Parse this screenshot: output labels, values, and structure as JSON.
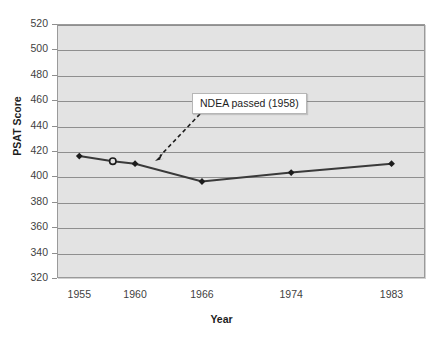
{
  "chart_data": {
    "type": "line",
    "title": "",
    "xlabel": "Year",
    "ylabel": "PSAT Score",
    "x": [
      1955,
      1958,
      1960,
      1966,
      1974,
      1983
    ],
    "values": [
      416,
      412,
      410,
      396,
      403,
      410
    ],
    "categories": [
      "1955",
      "1958",
      "1960",
      "1966",
      "1974",
      "1983"
    ],
    "x_tick_labels": [
      "1955",
      "1960",
      "1966",
      "1974",
      "1983"
    ],
    "x_tick_values": [
      1955,
      1960,
      1966,
      1974,
      1983
    ],
    "y_tick_labels": [
      "320",
      "340",
      "360",
      "380",
      "400",
      "420",
      "440",
      "460",
      "480",
      "500",
      "520"
    ],
    "y_tick_values": [
      320,
      340,
      360,
      380,
      400,
      420,
      440,
      460,
      480,
      500,
      520
    ],
    "ylim": [
      320,
      520
    ],
    "xlim": [
      1953,
      1986
    ],
    "grid": "horizontal",
    "legend": "none",
    "series_color": "#3a3a3a",
    "plot_background": "#e3e3e3",
    "annotations": [
      {
        "text": "NDEA passed (1958)",
        "points_to_x": 1958,
        "points_to_y": 412,
        "arrow_style": "dashed"
      }
    ]
  },
  "annotation": {
    "label": "NDEA passed (1958)"
  },
  "axes": {
    "x_title": "Year",
    "y_title": "PSAT Score"
  }
}
